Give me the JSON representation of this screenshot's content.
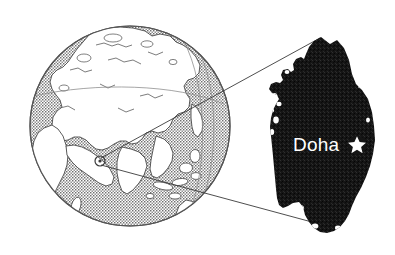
{
  "figure": {
    "kind": "locator-map",
    "background_color": "#ffffff"
  },
  "globe": {
    "name": "world-globe",
    "hemisphere_shown": "Eastern Hemisphere (Europe, Africa, Asia, Australia)",
    "center_x": 130,
    "center_y": 126,
    "radius": 100,
    "ocean_color": "#b4b4b4",
    "land_color": "#ffffff",
    "outline_color": "#555555",
    "marker": {
      "name": "qatar-location-marker",
      "label": "",
      "x": 100,
      "y": 161,
      "radius": 5
    }
  },
  "inset": {
    "name": "qatar-inset",
    "shape_label": "Qatar peninsula",
    "fill_color": "#161616",
    "bounds": {
      "x": 268,
      "y": 36,
      "width": 120,
      "height": 198
    },
    "city": {
      "name": "Doha",
      "label": "Doha",
      "label_x": 293,
      "label_y": 151,
      "label_color": "#ffffff",
      "star_x": 357,
      "star_y": 145,
      "star_color": "#ffffff",
      "star_glyph": "star-marker"
    }
  },
  "connectors": {
    "name": "zoom-connector-lines",
    "color": "#3a3a3a",
    "lines": [
      {
        "label": "upper-connector",
        "x1": 101,
        "y1": 158,
        "x2": 320,
        "y2": 38
      },
      {
        "label": "lower-connector",
        "x1": 101,
        "y1": 165,
        "x2": 323,
        "y2": 225
      }
    ]
  }
}
